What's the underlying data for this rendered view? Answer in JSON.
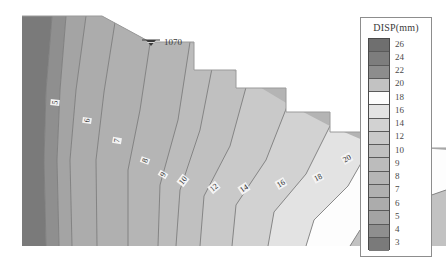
{
  "figure": {
    "name": "slope-displacement-contour-plot",
    "background_color": "#ffffff"
  },
  "annotation": {
    "water_table_symbol": "water-table-icon",
    "elevation_label": "1070"
  },
  "legend": {
    "title": "DISP(mm)",
    "border_color": "#8d8d8d",
    "labels": [
      "26",
      "24",
      "22",
      "20",
      "18",
      "16",
      "14",
      "12",
      "10",
      "9",
      "8",
      "7",
      "6",
      "5",
      "4",
      "3"
    ],
    "colors": [
      "#6f6f6f",
      "#7d7d7d",
      "#8d8d8d",
      "#c2c2c2",
      "#fdfdfd",
      "#e3e3e3",
      "#d2d2d2",
      "#c9c9c9",
      "#c0c0c0",
      "#bcbcbc",
      "#b5b5b5",
      "#b0b0b0",
      "#acacac",
      "#a4a4a4",
      "#8f8f8f",
      "#7a7a7a"
    ]
  },
  "chart_data": {
    "type": "heatmap",
    "title": "",
    "subtitle": "",
    "xlabel": "",
    "ylabel": "",
    "grid": false,
    "legend_position": "right",
    "variable": "DISP",
    "units": "mm",
    "colorbar_levels": [
      26,
      24,
      22,
      20,
      18,
      16,
      14,
      12,
      10,
      9,
      8,
      7,
      6,
      5,
      4,
      3
    ],
    "contour_labels": [
      {
        "value": "5",
        "x": 56,
        "y": 102,
        "rot": -84
      },
      {
        "value": "6",
        "x": 88,
        "y": 119,
        "rot": -82
      },
      {
        "value": "7",
        "x": 118,
        "y": 139,
        "rot": -80
      },
      {
        "value": "8",
        "x": 146,
        "y": 158,
        "rot": -72
      },
      {
        "value": "9",
        "x": 163,
        "y": 172,
        "rot": -62
      },
      {
        "value": "10",
        "x": 182,
        "y": 178,
        "rot": -52
      },
      {
        "value": "12",
        "x": 213,
        "y": 185,
        "rot": -40
      },
      {
        "value": "14",
        "x": 243,
        "y": 186,
        "rot": -34
      },
      {
        "value": "16",
        "x": 280,
        "y": 181,
        "rot": -30
      },
      {
        "value": "18",
        "x": 316,
        "y": 175,
        "rot": -28
      },
      {
        "value": "19",
        "x": 317,
        "y": 176,
        "rot": -28
      },
      {
        "value": "20",
        "x": 345,
        "y": 156,
        "rot": -30
      }
    ],
    "domain_outline": "stepped-slope-benched-excavation"
  }
}
